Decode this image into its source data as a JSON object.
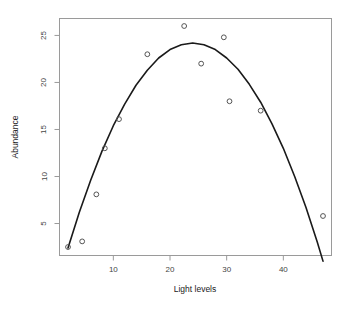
{
  "chart_data": {
    "type": "scatter",
    "title": "",
    "subtitle": "",
    "xlabel": "Light levels",
    "ylabel": "Abundance",
    "xlim": [
      0.5,
      48.5
    ],
    "ylim": [
      1.6,
      26.8
    ],
    "grid": false,
    "legend": null,
    "x_ticks": [
      10,
      20,
      30,
      40
    ],
    "y_ticks": [
      5,
      10,
      15,
      20,
      25
    ],
    "x_tick_labels": [
      "10",
      "20",
      "30",
      "40"
    ],
    "y_tick_labels": [
      "5",
      "10",
      "15",
      "20",
      "25"
    ],
    "point_marker": "open-circle",
    "point_color": "#555555",
    "line_color": "#1a1a1a",
    "box_color": "#9a9a9a",
    "background": "#ffffff",
    "x": [
      2.0,
      4.5,
      7.0,
      8.5,
      11.0,
      16.0,
      22.5,
      25.5,
      29.5,
      30.5,
      36.0,
      47.0
    ],
    "y": [
      2.5,
      3.1,
      8.1,
      13.0,
      16.1,
      23.0,
      26.0,
      22.0,
      24.8,
      18.0,
      17.0,
      5.8
    ],
    "series": [
      {
        "name": "observations",
        "points": [
          {
            "x": 2.0,
            "y": 2.5
          },
          {
            "x": 4.5,
            "y": 3.1
          },
          {
            "x": 7.0,
            "y": 8.1
          },
          {
            "x": 8.5,
            "y": 13.0
          },
          {
            "x": 11.0,
            "y": 16.1
          },
          {
            "x": 16.0,
            "y": 23.0
          },
          {
            "x": 22.5,
            "y": 26.0
          },
          {
            "x": 25.5,
            "y": 22.0
          },
          {
            "x": 29.5,
            "y": 24.8
          },
          {
            "x": 30.5,
            "y": 18.0
          },
          {
            "x": 36.0,
            "y": 17.0
          },
          {
            "x": 47.0,
            "y": 5.8
          }
        ]
      },
      {
        "name": "fitted-quadratic-curve",
        "type": "line",
        "points": [
          {
            "x": 2.0,
            "y": 2.4
          },
          {
            "x": 4.0,
            "y": 6.2
          },
          {
            "x": 6.0,
            "y": 9.6
          },
          {
            "x": 8.0,
            "y": 12.7
          },
          {
            "x": 10.0,
            "y": 15.4
          },
          {
            "x": 12.0,
            "y": 17.7
          },
          {
            "x": 14.0,
            "y": 19.7
          },
          {
            "x": 16.0,
            "y": 21.3
          },
          {
            "x": 18.0,
            "y": 22.6
          },
          {
            "x": 20.0,
            "y": 23.5
          },
          {
            "x": 22.0,
            "y": 24.0
          },
          {
            "x": 24.0,
            "y": 24.2
          },
          {
            "x": 26.0,
            "y": 24.0
          },
          {
            "x": 28.0,
            "y": 23.5
          },
          {
            "x": 30.0,
            "y": 22.6
          },
          {
            "x": 32.0,
            "y": 21.4
          },
          {
            "x": 34.0,
            "y": 19.8
          },
          {
            "x": 36.0,
            "y": 17.9
          },
          {
            "x": 38.0,
            "y": 15.6
          },
          {
            "x": 40.0,
            "y": 13.0
          },
          {
            "x": 42.0,
            "y": 10.0
          },
          {
            "x": 44.0,
            "y": 6.7
          },
          {
            "x": 46.0,
            "y": 3.0
          },
          {
            "x": 47.0,
            "y": 1.0
          }
        ]
      }
    ]
  }
}
